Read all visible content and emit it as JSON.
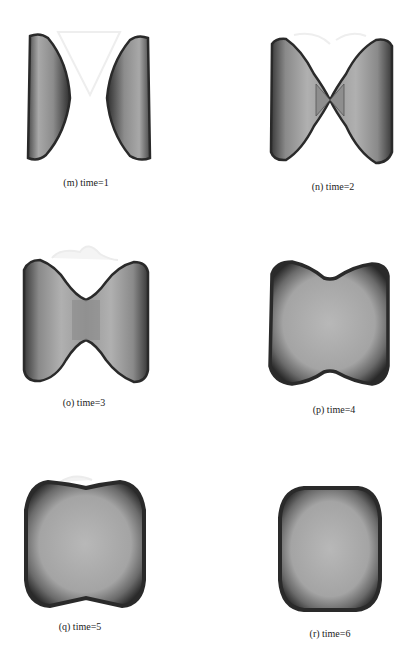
{
  "figure": {
    "panels": [
      {
        "id": "m",
        "caption": "(m) time=1",
        "time": 1,
        "shape": "two separated lens halves"
      },
      {
        "id": "n",
        "caption": "(n) time=2",
        "time": 2,
        "shape": "bowtie with touching neck"
      },
      {
        "id": "o",
        "caption": "(o) time=3",
        "time": 3,
        "shape": "bowtie with widened neck"
      },
      {
        "id": "p",
        "caption": "(p) time=4",
        "time": 4,
        "shape": "peanut / waisted block"
      },
      {
        "id": "q",
        "caption": "(q) time=5",
        "time": 5,
        "shape": "slightly waisted rounded block"
      },
      {
        "id": "r",
        "caption": "(r) time=6",
        "time": 6,
        "shape": "rounded rectangle"
      }
    ],
    "colors": {
      "edge": "#2a2a2a",
      "fill_dark": "#6e6e6e",
      "fill_light": "#b5b5b5",
      "ghost": "#ececec",
      "background": "#ffffff"
    }
  }
}
